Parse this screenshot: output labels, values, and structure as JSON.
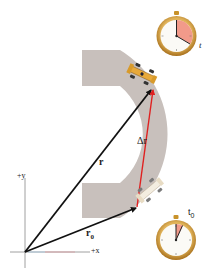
{
  "figure": {
    "labels": {
      "r": "r",
      "delta_r": "Δr",
      "r0_base": "r",
      "r0_sub": "0",
      "axis_y": "+y",
      "axis_x": "+x",
      "time_t": "t",
      "time_t0_base": "t",
      "time_t0_sub": "0"
    },
    "colors": {
      "track": "#c8c0bc",
      "vector_r": "#111111",
      "vector_delta_r": "#e02020",
      "stopwatch_rim": "#c8922a",
      "stopwatch_face": "#fbfaf6",
      "elapsed_wedge": "#f29a8a",
      "car_body_top": "#e8a93a",
      "car_body_bottom": "#f3ede0"
    },
    "stopwatches": [
      {
        "name": "stopwatch-t",
        "label": "t",
        "elapsed_fraction": 0.33
      },
      {
        "name": "stopwatch-t0",
        "label": "t0",
        "elapsed_fraction": 0.07
      }
    ]
  }
}
